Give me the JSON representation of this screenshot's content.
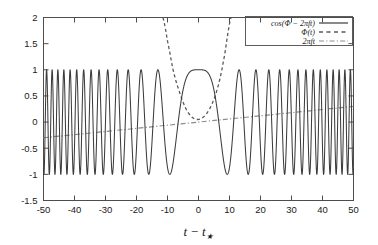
{
  "chart_data": {
    "type": "line",
    "title": "",
    "subtitle": "",
    "xlabel": "t − t★",
    "ylabel": "",
    "xlim": [
      -50,
      50
    ],
    "ylim": [
      -1.5,
      2
    ],
    "grid": false,
    "legend_position": "top-right",
    "xticks": [
      -50,
      -40,
      -30,
      -20,
      -10,
      0,
      10,
      20,
      30,
      40,
      50
    ],
    "xtick_labels": [
      "-50",
      "-40",
      "-30",
      "-20",
      "-10",
      "0",
      "10",
      "20",
      "30",
      "40",
      "50"
    ],
    "yticks": [
      -1.5,
      -1,
      -0.5,
      0,
      0.5,
      1,
      1.5,
      2
    ],
    "ytick_labels": [
      "-1.5",
      "-1",
      "-0.5",
      "0",
      "0.5",
      "1",
      "1.5",
      "2"
    ],
    "series": [
      {
        "name": "cos(Φ − 2πft)",
        "style": "solid",
        "color": "#3c3c3c",
        "description": "Chirped cosine: oscillation frequency is highest at the edges and drops to zero near t-t*=0 where the waveform flattens at +1.",
        "amplitude": 1.0,
        "envelope_min": -1.0,
        "envelope_max": 1.05,
        "flat_top_range": [
          -4,
          4
        ],
        "flat_top_value": 1.0,
        "zero_frequency_at": 0,
        "x": [
          -50,
          -45,
          -40,
          -35,
          -30,
          -25,
          -20,
          -15,
          -10,
          -5,
          0,
          5,
          10,
          15,
          20,
          25,
          30,
          35,
          40,
          45,
          50
        ],
        "approx_peaks_x": [
          -49,
          -45,
          -40.5,
          -35,
          -28.5,
          -20.5,
          -6,
          0,
          6,
          20,
          28,
          34,
          40,
          45,
          49
        ],
        "approx_troughs_x": [
          -47,
          -42.5,
          -38,
          -32.5,
          -24.5,
          -13.5,
          13.5,
          24.5,
          32,
          37.5,
          42.5,
          47
        ]
      },
      {
        "name": "Φ(t)",
        "style": "dashed",
        "color": "#5a5a5a",
        "description": "Steep, near-parabolic phase curve with a shallow minimum of about 0.05 at t-t*=0; rises off the top of the frame near t-t* = -11 and +10.",
        "minimum_value": 0.05,
        "minimum_at": 0,
        "visible_x_range": [
          -11.5,
          10.5
        ],
        "x": [
          -11.5,
          -10,
          -8,
          -6,
          -4,
          -2,
          0,
          2,
          4,
          6,
          8,
          10.5
        ],
        "y": [
          2.0,
          1.55,
          0.95,
          0.55,
          0.25,
          0.09,
          0.05,
          0.12,
          0.3,
          0.62,
          1.15,
          2.0
        ]
      },
      {
        "name": "2πft",
        "style": "dash-dot",
        "color": "#8c8c8c",
        "description": "Straight reference line rising linearly across the full x-range.",
        "slope": 0.006,
        "intercept": 0.0,
        "x": [
          -50,
          50
        ],
        "y": [
          -0.3,
          0.3
        ]
      }
    ]
  },
  "legend": {
    "entries": [
      {
        "label": "cos(Φ − 2πft)",
        "style": "solid"
      },
      {
        "label": "Φ(t)",
        "style": "dashed"
      },
      {
        "label": "2πft",
        "style": "dash-dot"
      }
    ]
  },
  "axes": {
    "x_title": "t − t★",
    "x_title_parts": {
      "var": "t",
      "minus": "−",
      "var2": "t",
      "subscript": "★"
    },
    "x_tick_labels": [
      "-50",
      "-40",
      "-30",
      "-20",
      "-10",
      "0",
      "10",
      "20",
      "30",
      "40",
      "50"
    ],
    "y_tick_labels": [
      "2",
      "1.5",
      "1",
      "0.5",
      "0",
      "-0.5",
      "-1",
      "-1.5"
    ]
  },
  "colors": {
    "background": "#ffffff",
    "frame": "#4d4d4d",
    "solid_curve": "#3c3c3c",
    "dashed_curve": "#5a5a5a",
    "dashdot_curve": "#8c8c8c",
    "text": "#1a1a1a"
  }
}
